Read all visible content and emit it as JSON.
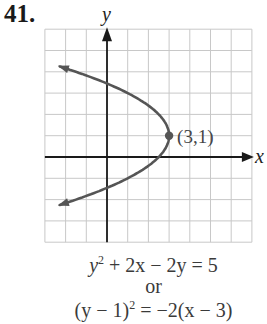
{
  "problem": {
    "number": "41."
  },
  "chart_data": {
    "type": "line",
    "title": "",
    "xlabel": "x",
    "ylabel": "y",
    "xlim": [
      -3,
      7
    ],
    "ylim": [
      -4,
      6
    ],
    "grid": true,
    "curve": {
      "name": "parabola opening left",
      "equation": "(y - 1)^2 = -2(x - 3)",
      "vertex": [
        3,
        1
      ],
      "arrows": [
        "upper-left",
        "lower-left"
      ],
      "points": [
        [
          -3,
          4.46
        ],
        [
          -1,
          3.83
        ],
        [
          0,
          3.45
        ],
        [
          1,
          3.0
        ],
        [
          2,
          2.41
        ],
        [
          2.5,
          2.0
        ],
        [
          3,
          1
        ],
        [
          2.5,
          0.0
        ],
        [
          2,
          -0.41
        ],
        [
          1,
          -1.0
        ],
        [
          0,
          -1.45
        ],
        [
          -1,
          -1.83
        ],
        [
          -3,
          -2.46
        ]
      ]
    },
    "annotations": [
      {
        "label": "(3,1)",
        "x": 3,
        "y": 1,
        "marker": "dot"
      }
    ],
    "colors": {
      "curve": "#555555",
      "grid": "#c8c8c8",
      "axis": "#1a1a1a"
    }
  },
  "equations": {
    "standard": {
      "pre": "y",
      "exp": "2",
      "post": " + 2x − 2y = 5"
    },
    "connector": "or",
    "vertex_form": {
      "pre": "(y − 1)",
      "exp": "2",
      "post": " = −2(x − 3)"
    }
  },
  "labels": {
    "vertex": "(3,1)",
    "x_axis": "x",
    "y_axis": "y"
  }
}
